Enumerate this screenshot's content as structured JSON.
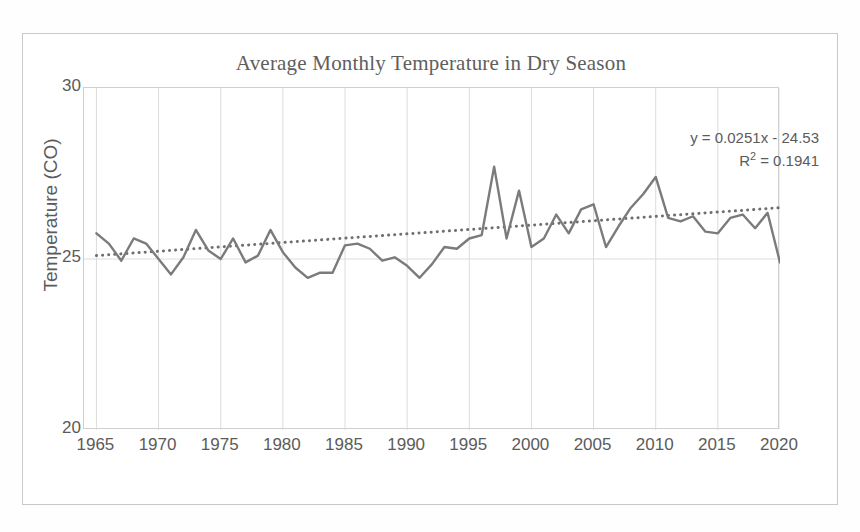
{
  "chart_data": {
    "type": "line",
    "title": "Average Monthly Temperature in Dry Season",
    "xlabel": "",
    "ylabel": "Temperature (CO)",
    "xlim": [
      1964,
      2020
    ],
    "ylim": [
      20,
      30
    ],
    "y_ticks": [
      "30",
      "25",
      "20"
    ],
    "y_tick_values": [
      30,
      25,
      20
    ],
    "x_ticks": [
      "1965",
      "1970",
      "1975",
      "1980",
      "1985",
      "1990",
      "1995",
      "2000",
      "2005",
      "2010",
      "2015",
      "2020"
    ],
    "x_tick_values": [
      1965,
      1970,
      1975,
      1980,
      1985,
      1990,
      1995,
      2000,
      2005,
      2010,
      2015,
      2020
    ],
    "grid": true,
    "grid_x": true,
    "grid_y": true,
    "legend": false,
    "legend_position": "none",
    "x": [
      1965,
      1966,
      1967,
      1968,
      1969,
      1970,
      1971,
      1972,
      1973,
      1974,
      1975,
      1976,
      1977,
      1978,
      1979,
      1980,
      1981,
      1982,
      1983,
      1984,
      1985,
      1986,
      1987,
      1988,
      1989,
      1990,
      1991,
      1992,
      1993,
      1994,
      1995,
      1996,
      1997,
      1998,
      1999,
      2000,
      2001,
      2002,
      2003,
      2004,
      2005,
      2006,
      2007,
      2008,
      2009,
      2010,
      2011,
      2012,
      2013,
      2014,
      2015,
      2016,
      2017,
      2018,
      2019,
      2020
    ],
    "series": [
      {
        "name": "Average monthly temperature",
        "style": "solid",
        "color": "#7b7b7b",
        "values": [
          25.75,
          25.45,
          24.95,
          25.6,
          25.45,
          25.0,
          24.55,
          25.05,
          25.85,
          25.25,
          25.0,
          25.6,
          24.9,
          25.1,
          25.85,
          25.2,
          24.75,
          24.45,
          24.6,
          24.6,
          25.4,
          25.45,
          25.3,
          24.95,
          25.05,
          24.8,
          24.45,
          24.85,
          25.35,
          25.3,
          25.6,
          25.7,
          27.7,
          25.6,
          27.0,
          25.35,
          25.6,
          26.3,
          25.75,
          26.45,
          26.6,
          25.35,
          25.95,
          26.5,
          26.9,
          27.4,
          26.2,
          26.1,
          26.25,
          25.8,
          25.75,
          26.2,
          26.3,
          25.9,
          26.35,
          24.9
        ]
      },
      {
        "name": "Linear trendline",
        "style": "dotted",
        "color": "#6f6f6f",
        "equation": "y = 0.0251x - 24.53",
        "r_squared": "R² = 0.1941",
        "slope": 0.0251,
        "intercept": -24.53,
        "start": [
          1965,
          25.1
        ],
        "end": [
          2020,
          26.5
        ]
      }
    ],
    "annotations": [
      {
        "text": "y = 0.0251x - 24.53",
        "position": "top-right"
      },
      {
        "text": "R² = 0.1941",
        "position": "top-right"
      }
    ],
    "colors": {
      "line": "#7b7b7b",
      "trendline": "#6f6f6f",
      "grid": "#dcdcdc",
      "axis": "#cfcfcf",
      "text": "#5b5b5b",
      "title": "#5e5e5e",
      "frame": "#c9c9c9",
      "background": "#ffffff"
    }
  },
  "equation": {
    "line1_prefix": "y = 0.0251x - 24.53",
    "line2_r": "R",
    "line2_sup": "2",
    "line2_rest": " = 0.1941"
  }
}
